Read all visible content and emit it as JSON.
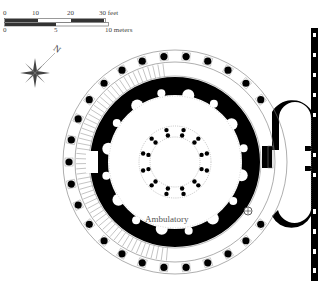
{
  "scale_bar": {
    "feet_ticks": [
      "0",
      "10",
      "20",
      "30 feet"
    ],
    "meter_ticks": [
      "0",
      "5",
      "10 meters"
    ]
  },
  "compass": {
    "label": "N",
    "icon": "compass-rose-icon"
  },
  "plan": {
    "label": "Ambulatory",
    "colors": {
      "wall": "#000000",
      "background": "#ffffff",
      "hatching": "#888888",
      "dotted": "#999999"
    },
    "outer_colonnade_columns": 30,
    "inner_column_pairs": 12
  }
}
